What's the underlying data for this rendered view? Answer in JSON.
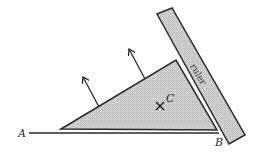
{
  "diagram": {
    "labels": {
      "point_a": "A",
      "point_b": "B",
      "point_c": "C",
      "ruler": "ruler",
      "centroid_marker": "×"
    },
    "colors": {
      "fill": "#c8c8c8",
      "stroke": "#2a2a2a",
      "background": "#ffffff"
    },
    "elements": {
      "triangle": {
        "vertices": [
          [
            61,
            129
          ],
          [
            176,
            60
          ],
          [
            217,
            130
          ]
        ]
      },
      "ruler": {
        "corners": [
          [
            157,
            14
          ],
          [
            172,
            8
          ],
          [
            245,
            135
          ],
          [
            229,
            144
          ]
        ]
      },
      "baseline": {
        "from": [
          29,
          133
        ],
        "to": [
          219,
          133
        ]
      },
      "arrows": [
        {
          "from": [
            99,
            107
          ],
          "to": [
            83,
            77
          ]
        },
        {
          "from": [
            145,
            79
          ],
          "to": [
            129,
            49
          ]
        }
      ]
    }
  }
}
